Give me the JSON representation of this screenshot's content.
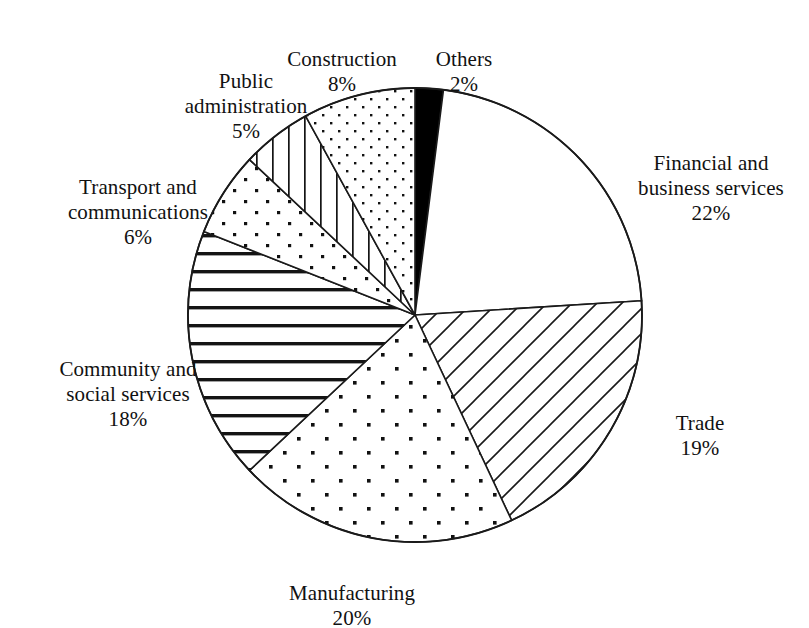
{
  "chart_data": {
    "type": "pie",
    "title": "",
    "subtitle": "",
    "xlabel": "",
    "ylabel": "",
    "grid": false,
    "legend_position": "none",
    "labels_outside": true,
    "start_angle_deg": 0,
    "direction": "clockwise",
    "total_pct": 100,
    "categories": [
      "Others",
      "Financial and business services",
      "Trade",
      "Manufacturing",
      "Community and social services",
      "Transport and communications",
      "Public administration",
      "Construction"
    ],
    "values": [
      2,
      22,
      19,
      20,
      18,
      6,
      5,
      8
    ],
    "slices": [
      {
        "name": "Others",
        "label": "Others",
        "percent_text": "2%",
        "value": 2,
        "fill": "solid-black",
        "color": "#000000"
      },
      {
        "name": "Financial and business services",
        "label": "Financial and\nbusiness services",
        "percent_text": "22%",
        "value": 22,
        "fill": "blank-white",
        "color": "#ffffff"
      },
      {
        "name": "Trade",
        "label": "Trade",
        "percent_text": "19%",
        "value": 19,
        "fill": "diagonal-lines",
        "color": "#ffffff"
      },
      {
        "name": "Manufacturing",
        "label": "Manufacturing",
        "percent_text": "20%",
        "value": 20,
        "fill": "coarse-dots",
        "color": "#ffffff"
      },
      {
        "name": "Community and social services",
        "label": "Community and\nsocial services",
        "percent_text": "18%",
        "value": 18,
        "fill": "thick-horizontal-lines",
        "color": "#ffffff"
      },
      {
        "name": "Transport and communications",
        "label": "Transport and\ncommunications",
        "percent_text": "6%",
        "value": 6,
        "fill": "medium-dots",
        "color": "#ffffff"
      },
      {
        "name": "Public administration",
        "label": "Public\nadministration",
        "percent_text": "5%",
        "value": 5,
        "fill": "vertical-lines",
        "color": "#ffffff"
      },
      {
        "name": "Construction",
        "label": "Construction",
        "percent_text": "8%",
        "value": 8,
        "fill": "fine-dots",
        "color": "#ffffff"
      }
    ],
    "stroke_color": "#1a1a1a",
    "background_color": "#ffffff"
  },
  "labels": {
    "construction": {
      "name": "Construction",
      "pct": "8%"
    },
    "others": {
      "name": "Others",
      "pct": "2%"
    },
    "public_administration": {
      "name": "Public\nadministration",
      "pct": "5%"
    },
    "transport": {
      "name": "Transport and\ncommunications",
      "pct": "6%"
    },
    "community": {
      "name": "Community and\nsocial services",
      "pct": "18%"
    },
    "manufacturing": {
      "name": "Manufacturing",
      "pct": "20%"
    },
    "trade": {
      "name": "Trade",
      "pct": "19%"
    },
    "financial": {
      "name": "Financial and\nbusiness services",
      "pct": "22%"
    }
  },
  "geometry": {
    "center_x": 415,
    "center_y": 315,
    "radius": 227
  }
}
